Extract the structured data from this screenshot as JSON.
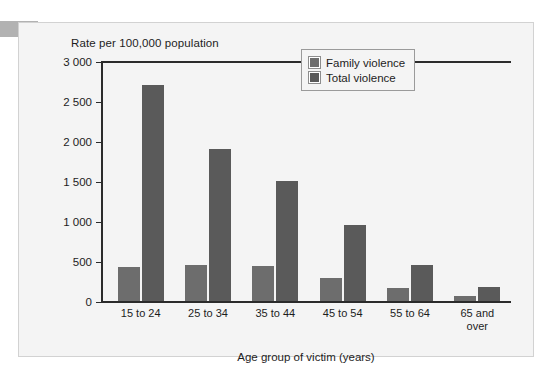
{
  "chart_data": {
    "type": "bar",
    "title": "",
    "ylabel": "Rate per 100,000 population",
    "xlabel": "Age group of victim (years)",
    "categories": [
      "15 to 24",
      "25 to 34",
      "35 to 44",
      "45 to 54",
      "55 to 64",
      "65 and\nover"
    ],
    "series": [
      {
        "name": "Family violence",
        "color": "#6d6d6d",
        "values": [
          430,
          450,
          440,
          285,
          160,
          60
        ]
      },
      {
        "name": "Total violence",
        "color": "#5a5a5a",
        "values": [
          2700,
          1900,
          1500,
          950,
          445,
          175
        ]
      }
    ],
    "ylim": [
      0,
      3000
    ],
    "ytick_values": [
      0,
      500,
      1000,
      1500,
      2000,
      2500,
      3000
    ],
    "ytick_labels": [
      "0",
      "500",
      "1 000",
      "1 500",
      "2 000",
      "2 500",
      "3 000"
    ],
    "grid": false,
    "legend_position": "top-right"
  },
  "legend": {
    "items": [
      {
        "label": "Family violence"
      },
      {
        "label": "Total violence"
      }
    ]
  }
}
